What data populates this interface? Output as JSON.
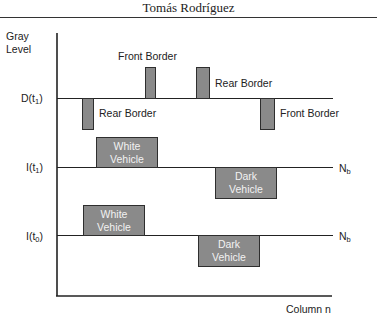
{
  "header": {
    "title": "Tomás Rodríguez"
  },
  "diagram": {
    "y_axis_label_line1": "Gray",
    "y_axis_label_line2": "Level",
    "x_axis_label": "Column n",
    "rows": [
      {
        "id": "D_t1",
        "label_main": "D(t",
        "label_sub": "1",
        "label_close": ")",
        "right_label": "",
        "elements": [
          {
            "type": "bar-up",
            "label": "Front Border"
          },
          {
            "type": "bar-up",
            "label": "Rear Border"
          },
          {
            "type": "bar-down",
            "label": "Rear Border"
          },
          {
            "type": "bar-down",
            "label": "Front Border"
          }
        ]
      },
      {
        "id": "I_t1",
        "label_main": "I(t",
        "label_sub": "1",
        "label_close": ")",
        "right_label_main": "N",
        "right_label_sub": "b",
        "elements": [
          {
            "type": "box-up",
            "label_line1": "White",
            "label_line2": "Vehicle"
          },
          {
            "type": "box-down",
            "label_line1": "Dark",
            "label_line2": "Vehicle"
          }
        ]
      },
      {
        "id": "I_t0",
        "label_main": "I(t",
        "label_sub": "0",
        "label_close": ")",
        "right_label_main": "N",
        "right_label_sub": "b",
        "elements": [
          {
            "type": "box-up",
            "label_line1": "White",
            "label_line2": "Vehicle"
          },
          {
            "type": "box-down",
            "label_line1": "Dark",
            "label_line2": "Vehicle"
          }
        ]
      }
    ]
  },
  "colors": {
    "bar_fill": "#8a8a8a",
    "bar_stroke": "#2e2e2e",
    "line": "#222222"
  }
}
